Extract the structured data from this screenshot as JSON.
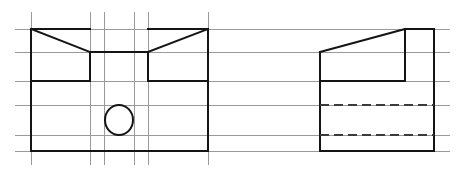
{
  "drawing": {
    "title": "Orthographic Projection Drawing",
    "sheet": {
      "width": 460,
      "height": 170,
      "background": "#ffffff"
    },
    "styles": {
      "grid_color": "#9a9a9a",
      "object_color": "#141414",
      "hidden_color": "#3a3a3a",
      "grid_width": 1,
      "object_width": 2,
      "hidden_width": 2,
      "hidden_dash": "9 5"
    },
    "grid": {
      "name": "construction-grid",
      "horizontal_lines": [
        {
          "y": 29,
          "x1": 15,
          "x2": 450
        },
        {
          "y": 52,
          "x1": 15,
          "x2": 450
        },
        {
          "y": 81,
          "x1": 15,
          "x2": 450
        },
        {
          "y": 105,
          "x1": 15,
          "x2": 450
        },
        {
          "y": 135,
          "x1": 15,
          "x2": 450
        },
        {
          "y": 151,
          "x1": 15,
          "x2": 450
        }
      ],
      "vertical_lines": [
        {
          "x": 31,
          "y1": 12,
          "y2": 165
        },
        {
          "x": 90,
          "y1": 12,
          "y2": 165
        },
        {
          "x": 104,
          "y1": 12,
          "y2": 165
        },
        {
          "x": 134,
          "y1": 12,
          "y2": 165
        },
        {
          "x": 148,
          "y1": 12,
          "y2": 165
        },
        {
          "x": 208,
          "y1": 12,
          "y2": 165
        }
      ]
    },
    "views": [
      {
        "name": "front-view",
        "label": "Front View",
        "bounds": {
          "left": 31,
          "right": 208,
          "top": 29,
          "bottom": 151
        },
        "outline_points": "31,29 90,52 148,52 208,29 208,151 31,151 31,29",
        "segments": [
          {
            "name": "front-top-left-chamfer",
            "x1": 31,
            "y1": 29,
            "x2": 90,
            "y2": 52
          },
          {
            "name": "front-notch-floor",
            "x1": 90,
            "y1": 52,
            "x2": 148,
            "y2": 52
          },
          {
            "name": "front-top-right-chamfer",
            "x1": 148,
            "y1": 52,
            "x2": 208,
            "y2": 29
          },
          {
            "name": "front-top-edge-left",
            "x1": 31,
            "y1": 29,
            "x2": 90,
            "y2": 29
          },
          {
            "name": "front-top-edge-right",
            "x1": 148,
            "y1": 29,
            "x2": 208,
            "y2": 29
          },
          {
            "name": "front-left-edge",
            "x1": 31,
            "y1": 29,
            "x2": 31,
            "y2": 151
          },
          {
            "name": "front-right-edge",
            "x1": 208,
            "y1": 29,
            "x2": 208,
            "y2": 151
          },
          {
            "name": "front-bottom-edge",
            "x1": 31,
            "y1": 151,
            "x2": 208,
            "y2": 151
          },
          {
            "name": "front-notch-left-wall",
            "x1": 90,
            "y1": 52,
            "x2": 90,
            "y2": 81
          },
          {
            "name": "front-notch-right-wall",
            "x1": 148,
            "y1": 52,
            "x2": 148,
            "y2": 81
          },
          {
            "name": "front-shoulder-left",
            "x1": 31,
            "y1": 81,
            "x2": 90,
            "y2": 81
          },
          {
            "name": "front-shoulder-right",
            "x1": 148,
            "y1": 81,
            "x2": 208,
            "y2": 81
          }
        ],
        "circle": {
          "name": "through-hole-circle",
          "cx": 119,
          "cy": 120,
          "rx": 14,
          "ry": 15
        }
      },
      {
        "name": "side-view",
        "label": "Side View",
        "bounds": {
          "left": 320,
          "right": 434,
          "top": 29,
          "bottom": 151
        },
        "segments": [
          {
            "name": "side-slant-edge",
            "x1": 320,
            "y1": 52,
            "x2": 405,
            "y2": 29
          },
          {
            "name": "side-top-edge",
            "x1": 405,
            "y1": 29,
            "x2": 434,
            "y2": 29
          },
          {
            "name": "side-right-edge",
            "x1": 434,
            "y1": 29,
            "x2": 434,
            "y2": 151
          },
          {
            "name": "side-bottom-edge",
            "x1": 320,
            "y1": 151,
            "x2": 434,
            "y2": 151
          },
          {
            "name": "side-left-edge",
            "x1": 320,
            "y1": 52,
            "x2": 320,
            "y2": 151
          },
          {
            "name": "side-step-vertical",
            "x1": 405,
            "y1": 29,
            "x2": 405,
            "y2": 81
          },
          {
            "name": "side-step-floor",
            "x1": 320,
            "y1": 81,
            "x2": 405,
            "y2": 81
          }
        ],
        "hidden_segments": [
          {
            "name": "side-hidden-line-upper",
            "x1": 320,
            "y1": 105,
            "x2": 434,
            "y2": 105
          },
          {
            "name": "side-hidden-line-lower",
            "x1": 320,
            "y1": 135,
            "x2": 434,
            "y2": 135
          }
        ]
      }
    ]
  }
}
